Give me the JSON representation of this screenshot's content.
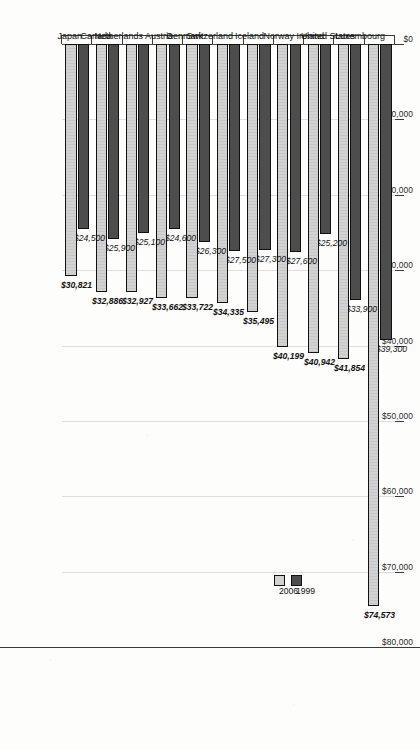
{
  "chart_data": {
    "type": "bar",
    "title": "",
    "xlabel": "",
    "ylabel": "",
    "orientation": "vertical-bars-on-rotated-page",
    "grid": true,
    "legend_position": "upper-right",
    "ylim": [
      0,
      80000
    ],
    "yticks": [
      0,
      10000,
      20000,
      30000,
      40000,
      50000,
      60000,
      70000,
      80000
    ],
    "ytick_labels": [
      "$0",
      "$10,000",
      "$20,000",
      "$30,000",
      "$40,000",
      "$50,000",
      "$60,000",
      "$70,000",
      "$80,000"
    ],
    "categories": [
      "Luxembourg",
      "United States",
      "Ireland",
      "Norway",
      "Iceland",
      "Switzerland",
      "Denmark",
      "Austria",
      "Netherlands",
      "Canada",
      "Japan"
    ],
    "series": [
      {
        "name": "1999",
        "color": "#4d4d4d",
        "values": [
          39300,
          33900,
          25200,
          27600,
          27300,
          27500,
          26300,
          24600,
          25100,
          25900,
          24500
        ],
        "labels": [
          "$39,300",
          "$33,900",
          "$25,200",
          "$27,600",
          "$27,300",
          "$27,500",
          "$26,300",
          "$24,600",
          "$25,100",
          "$25,900",
          "$24,500"
        ],
        "label_style": "plain"
      },
      {
        "name": "2006",
        "color": "#d2d2d2",
        "values": [
          74573,
          41854,
          40942,
          40199,
          35495,
          34335,
          33722,
          33662,
          32927,
          32886,
          30821
        ],
        "labels": [
          "$74,573",
          "$41,854",
          "$40,942",
          "$40,199",
          "$35,495",
          "$34,335",
          "$33,722",
          "$33,662",
          "$32,927",
          "$32,886",
          "$30,821"
        ],
        "label_style": "bold"
      }
    ]
  },
  "legend": {
    "items": [
      {
        "label": "1999",
        "swatch": "s1999"
      },
      {
        "label": "2006",
        "swatch": "s2006"
      }
    ]
  }
}
